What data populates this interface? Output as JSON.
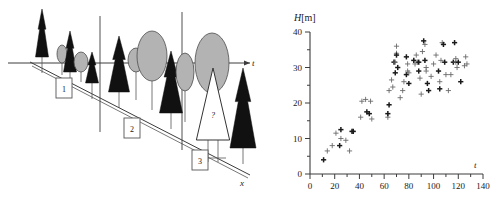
{
  "figure": {
    "title": "",
    "panels": [
      {
        "id": "left",
        "name": "chronosequence-diagram"
      },
      {
        "id": "right",
        "name": "height-time-scatter"
      }
    ]
  },
  "left_panel": {
    "horizontal_axis_label": "t",
    "depth_axis_label": "x",
    "markers": [
      {
        "label": "1"
      },
      {
        "label": "2"
      },
      {
        "label": "3"
      }
    ],
    "unknown_tree_label": "?",
    "legend_note": "",
    "colors": {
      "conifer_dark": "#111111",
      "deciduous_gray": "#b3b3b3",
      "deciduous_stroke": "#4d4d4d",
      "unknown_fill": "#ffffff",
      "line": "#3c3c3c"
    },
    "trees": [
      {
        "kind": "conifer",
        "x": 42,
        "base": 57,
        "h": 48,
        "w": 13
      },
      {
        "kind": "deciduous",
        "cx": 62,
        "cy": 54,
        "rx": 5,
        "ry": 9,
        "base": 75
      },
      {
        "kind": "conifer",
        "x": 70,
        "base": 72,
        "h": 41,
        "w": 13
      },
      {
        "kind": "deciduous",
        "cx": 81,
        "cy": 62,
        "rx": 7,
        "ry": 10,
        "base": 82
      },
      {
        "kind": "conifer",
        "x": 92,
        "base": 83,
        "h": 31,
        "w": 13
      },
      {
        "kind": "conifer",
        "x": 119,
        "base": 92,
        "h": 56,
        "w": 21
      },
      {
        "kind": "deciduous",
        "cx": 136,
        "cy": 60,
        "rx": 8,
        "ry": 12,
        "base": 100
      },
      {
        "kind": "deciduous",
        "cx": 152,
        "cy": 56,
        "rx": 15,
        "ry": 25,
        "base": 110
      },
      {
        "kind": "conifer",
        "x": 171,
        "base": 113,
        "h": 62,
        "w": 23
      },
      {
        "kind": "deciduous",
        "cx": 185,
        "cy": 72,
        "rx": 9,
        "ry": 19,
        "base": 122
      },
      {
        "kind": "deciduous",
        "cx": 212,
        "cy": 63,
        "rx": 17,
        "ry": 30,
        "base": 140
      },
      {
        "kind": "unknown",
        "x": 213,
        "base": 140,
        "h": 72,
        "w": 32
      },
      {
        "kind": "conifer",
        "x": 243,
        "base": 148,
        "h": 80,
        "w": 26
      }
    ]
  },
  "chart_data": {
    "type": "scatter",
    "title": "",
    "ylabel": "H[m]",
    "xlabel": "t",
    "xlim": [
      0,
      140
    ],
    "ylim": [
      0,
      40
    ],
    "xticks": [
      0,
      20,
      40,
      60,
      80,
      100,
      120,
      140
    ],
    "yticks": [
      0,
      10,
      20,
      30,
      40
    ],
    "xminor_step": 10,
    "yminor_step": 5,
    "grid": false,
    "legend": null,
    "marker": "plus",
    "points": [
      [
        11,
        4
      ],
      [
        14,
        6.5
      ],
      [
        18,
        8
      ],
      [
        21,
        11.5
      ],
      [
        24,
        8
      ],
      [
        25,
        12.5
      ],
      [
        25,
        10
      ],
      [
        29,
        9.5
      ],
      [
        32,
        6.5
      ],
      [
        34,
        12
      ],
      [
        35,
        12
      ],
      [
        41,
        16
      ],
      [
        42,
        20.5
      ],
      [
        45,
        21
      ],
      [
        46,
        17.5
      ],
      [
        48,
        17
      ],
      [
        49,
        20.5
      ],
      [
        50,
        15.5
      ],
      [
        63,
        16
      ],
      [
        63,
        17
      ],
      [
        64,
        19.5
      ],
      [
        64,
        23.5
      ],
      [
        66,
        26.5
      ],
      [
        67,
        24.5
      ],
      [
        68,
        31.5
      ],
      [
        69,
        28.5
      ],
      [
        69,
        31.5
      ],
      [
        70,
        34
      ],
      [
        70,
        36
      ],
      [
        70,
        33.5
      ],
      [
        71,
        30
      ],
      [
        73,
        21.5
      ],
      [
        75,
        23.5
      ],
      [
        76,
        26
      ],
      [
        78,
        33
      ],
      [
        78,
        28
      ],
      [
        79,
        29
      ],
      [
        79,
        31
      ],
      [
        80,
        28.5
      ],
      [
        80,
        25.5
      ],
      [
        84,
        32
      ],
      [
        85,
        31
      ],
      [
        86,
        33.5
      ],
      [
        87,
        31.5
      ],
      [
        88,
        31.5
      ],
      [
        88,
        29
      ],
      [
        89,
        27
      ],
      [
        90,
        22.5
      ],
      [
        91,
        34.5
      ],
      [
        92,
        37.5
      ],
      [
        93,
        32
      ],
      [
        93,
        36.5
      ],
      [
        94,
        30
      ],
      [
        94,
        29
      ],
      [
        95,
        25.5
      ],
      [
        96,
        23.5
      ],
      [
        98,
        27.5
      ],
      [
        100,
        31
      ],
      [
        102,
        33.5
      ],
      [
        104,
        29
      ],
      [
        105,
        24
      ],
      [
        105,
        26
      ],
      [
        106,
        32
      ],
      [
        107,
        37
      ],
      [
        108,
        36.5
      ],
      [
        109,
        31.5
      ],
      [
        110,
        28
      ],
      [
        112,
        23.5
      ],
      [
        114,
        28
      ],
      [
        116,
        31.5
      ],
      [
        117,
        37
      ],
      [
        118,
        31.5
      ],
      [
        118,
        32.5
      ],
      [
        119,
        30
      ],
      [
        120,
        31.5
      ],
      [
        122,
        26
      ],
      [
        125,
        30.5
      ],
      [
        126,
        33
      ],
      [
        127,
        31
      ]
    ]
  }
}
